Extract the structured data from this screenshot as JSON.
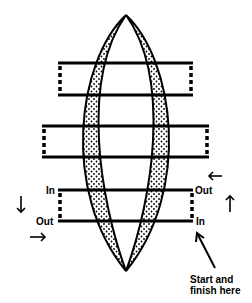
{
  "diagram": {
    "type": "lens-loop-path",
    "colors": {
      "stroke": "#000000",
      "fill_dots": "#000000",
      "background": "#ffffff"
    },
    "labels": {
      "in_left": "In",
      "out_left": "Out",
      "out_right": "Out",
      "in_right": "In",
      "start_line1": "Start and",
      "start_line2": "finish here"
    },
    "arrows": [
      {
        "name": "arrow-left-top-right",
        "direction": "left"
      },
      {
        "name": "arrow-up-right",
        "direction": "up"
      },
      {
        "name": "arrow-down-left",
        "direction": "down"
      },
      {
        "name": "arrow-right-left",
        "direction": "right"
      },
      {
        "name": "arrow-pointer-start",
        "direction": "up-left"
      }
    ],
    "bands": [
      {
        "name": "band-top",
        "y_top": 63,
        "y_bottom": 95,
        "x_left": 58,
        "x_right": 193
      },
      {
        "name": "band-middle",
        "y_top": 126,
        "y_bottom": 157,
        "x_left": 42,
        "x_right": 209
      },
      {
        "name": "band-bottom",
        "y_top": 190,
        "y_bottom": 221,
        "x_left": 58,
        "x_right": 193
      }
    ]
  }
}
